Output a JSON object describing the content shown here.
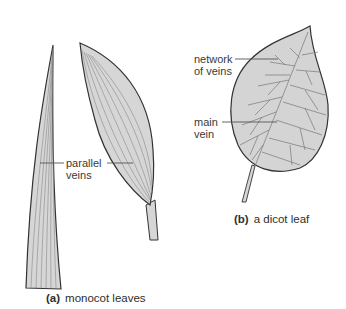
{
  "diagram": {
    "panels": [
      {
        "id": "a",
        "tag": "(a)",
        "caption": "monocot leaves",
        "labels": [
          {
            "line1": "parallel",
            "line2": "veins"
          }
        ]
      },
      {
        "id": "b",
        "tag": "(b)",
        "caption": "a dicot leaf",
        "labels": [
          {
            "line1": "network",
            "line2": "of veins"
          },
          {
            "line1": "main",
            "line2": "vein"
          }
        ]
      }
    ],
    "colors": {
      "leaf_fill": "#d4d4d4",
      "leaf_outline": "#3a3a3a",
      "vein": "#7a7a7a",
      "leader_line": "#555555",
      "text": "#333333"
    }
  }
}
